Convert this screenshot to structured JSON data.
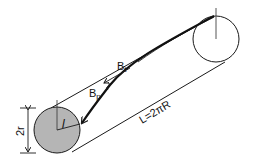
{
  "diagram": {
    "labels": {
      "bt_main": "B",
      "bt_sub": "t",
      "bp_main": "B",
      "bp_sub": "p",
      "length": "L=2πR",
      "diameter": "2r",
      "ell": "l"
    },
    "colors": {
      "stroke": "#1a1a1a",
      "small_circle_fill": "#b5b5b5",
      "large_circle_fill": "#ffffff",
      "background": "#ffffff"
    }
  }
}
